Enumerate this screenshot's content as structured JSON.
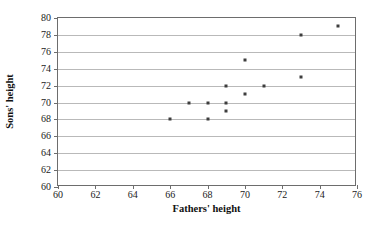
{
  "chart_data": {
    "type": "scatter",
    "title": "",
    "xlabel": "Fathers' height",
    "ylabel": "Sons' height",
    "xlim": [
      60,
      76
    ],
    "ylim": [
      60,
      80
    ],
    "xticks": [
      60,
      62,
      64,
      66,
      68,
      70,
      72,
      74,
      76
    ],
    "yticks": [
      60,
      62,
      64,
      66,
      68,
      70,
      72,
      74,
      76,
      78,
      80
    ],
    "grid": "horizontal",
    "legend": null,
    "marker_color": "#3d3d3d",
    "gridline_color": "#b9b9b9",
    "axis_color": "#6d6d6d",
    "points": [
      {
        "x": 66,
        "y": 68
      },
      {
        "x": 67,
        "y": 70
      },
      {
        "x": 68,
        "y": 68
      },
      {
        "x": 68,
        "y": 70
      },
      {
        "x": 69,
        "y": 69
      },
      {
        "x": 69,
        "y": 70
      },
      {
        "x": 69,
        "y": 72
      },
      {
        "x": 70,
        "y": 71
      },
      {
        "x": 70,
        "y": 75
      },
      {
        "x": 71,
        "y": 72
      },
      {
        "x": 73,
        "y": 73
      },
      {
        "x": 73,
        "y": 78
      },
      {
        "x": 75,
        "y": 79
      }
    ]
  }
}
